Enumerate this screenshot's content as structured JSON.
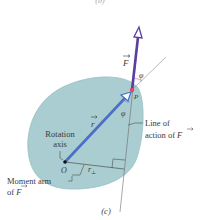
{
  "figure": {
    "top_caption": "(b)",
    "caption": "(c)",
    "labels": {
      "force": "F",
      "position": "r",
      "point": "P",
      "origin": "O",
      "angle_top": "φ",
      "angle_bottom": "φ",
      "perp_arm": "r",
      "perp_sub": "⊥",
      "rotation_axis_line1": "Rotation",
      "rotation_axis_line2": "axis",
      "line_of_action_line1": "Line of",
      "line_of_action_line2": "action of",
      "line_of_action_var": "F",
      "moment_arm_line1": "Moment arm",
      "moment_arm_line2": "of",
      "moment_arm_var": "F"
    },
    "colors": {
      "body_fill": "#a9cdd0",
      "body_edge": "#97bfc3",
      "force_vector": "#5b3f9e",
      "position_vector": "#4a6fc4",
      "point_marker": "#e8436a",
      "guide_line": "#6c6c6c",
      "text": "#3a3a3a"
    }
  }
}
